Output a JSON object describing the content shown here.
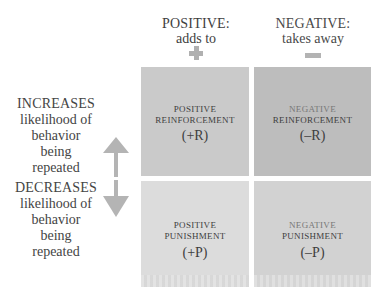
{
  "columns": {
    "positive": {
      "title": "POSITIVE:",
      "subtitle": "adds to",
      "sign": "+"
    },
    "negative": {
      "title": "NEGATIVE:",
      "subtitle": "takes away",
      "sign": "−"
    }
  },
  "rows": {
    "increases": {
      "title": "INCREASES",
      "lines": [
        "likelihood of",
        "behavior",
        "being",
        "repeated"
      ]
    },
    "decreases": {
      "title": "DECREASES",
      "lines": [
        "likelihood of",
        "behavior",
        "being",
        "repeated"
      ]
    }
  },
  "cells": {
    "positive_reinforcement": {
      "line1": "POSITIVE",
      "line2": "REINFORCEMENT",
      "abbr": "(+R)"
    },
    "negative_reinforcement": {
      "line1": "NEGATIVE",
      "line2": "REINFORCEMENT",
      "abbr": "(–R)"
    },
    "positive_punishment": {
      "line1": "POSITIVE",
      "line2": "PUNISHMENT",
      "abbr": "(+P)"
    },
    "negative_punishment": {
      "line1": "NEGATIVE",
      "line2": "PUNISHMENT",
      "abbr": "(–P)"
    }
  },
  "colors": {
    "positive_reinforcement": "#cacaca",
    "negative_reinforcement": "#bdbdbd",
    "positive_punishment": "#dcdcdc",
    "negative_punishment": "#d2d2d2",
    "arrow": "#b4b4b4"
  }
}
